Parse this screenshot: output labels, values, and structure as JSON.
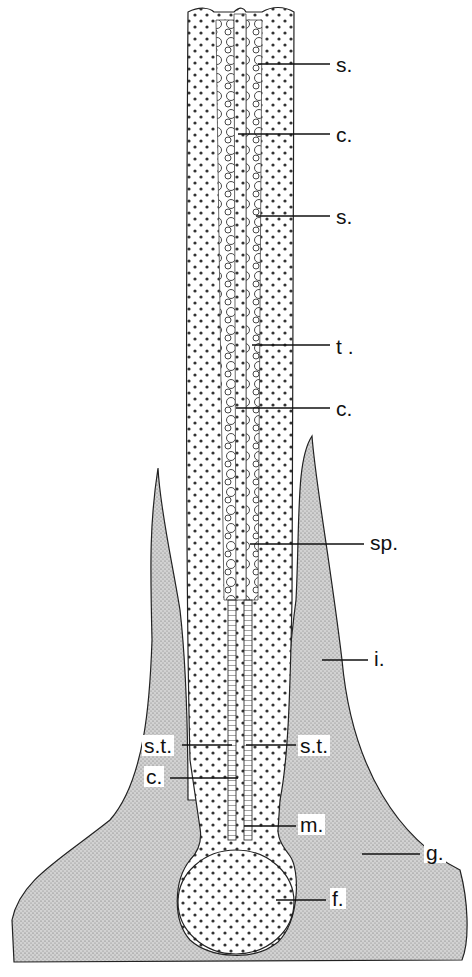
{
  "figure": {
    "type": "anatomical line drawing (longitudinal section)",
    "colors": {
      "ink": "#111111",
      "stipple_bg": "#c8c8c8",
      "paper": "#ffffff"
    }
  },
  "labels": [
    {
      "id": "s1",
      "text": "s.",
      "x": 334,
      "y": 54
    },
    {
      "id": "c1",
      "text": "c.",
      "x": 334,
      "y": 124
    },
    {
      "id": "s2",
      "text": "s.",
      "x": 334,
      "y": 206
    },
    {
      "id": "t",
      "text": "t .",
      "x": 334,
      "y": 336
    },
    {
      "id": "c2",
      "text": "c.",
      "x": 334,
      "y": 398
    },
    {
      "id": "sp",
      "text": "sp.",
      "x": 368,
      "y": 539
    },
    {
      "id": "i",
      "text": "i.",
      "x": 372,
      "y": 652
    },
    {
      "id": "st_l",
      "text": "s.t.",
      "x": 142,
      "y": 735
    },
    {
      "id": "st_r",
      "text": "s.t.",
      "x": 298,
      "y": 735
    },
    {
      "id": "c3",
      "text": "c.",
      "x": 144,
      "y": 768
    },
    {
      "id": "m",
      "text": "m.",
      "x": 298,
      "y": 820
    },
    {
      "id": "g",
      "text": "g.",
      "x": 424,
      "y": 852
    },
    {
      "id": "f",
      "text": "f.",
      "x": 330,
      "y": 890
    }
  ]
}
